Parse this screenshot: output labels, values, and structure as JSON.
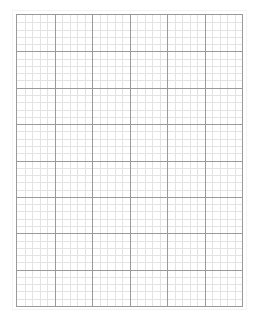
{
  "document": {
    "type": "graph-paper",
    "grid": {
      "major_columns": 6,
      "major_rows": 8,
      "minor_per_major": 5,
      "colors": {
        "major_line": "#9a9a9a",
        "minor_line": "#e3e3e3",
        "background": "#ffffff"
      }
    }
  }
}
